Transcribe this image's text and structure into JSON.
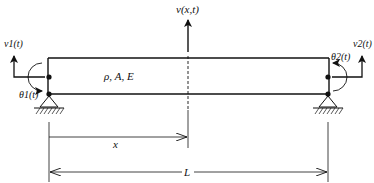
{
  "diagram": {
    "type": "beam-element",
    "labels": {
      "v_xt": "v(x,t)",
      "v1": "v1(t)",
      "v2": "v2(t)",
      "theta1": "θ1(t)",
      "theta2": "θ2(t)",
      "properties": "ρ, A, E",
      "x": "x",
      "L": "L"
    },
    "colors": {
      "stroke": "#111111",
      "background": "#ffffff"
    }
  }
}
